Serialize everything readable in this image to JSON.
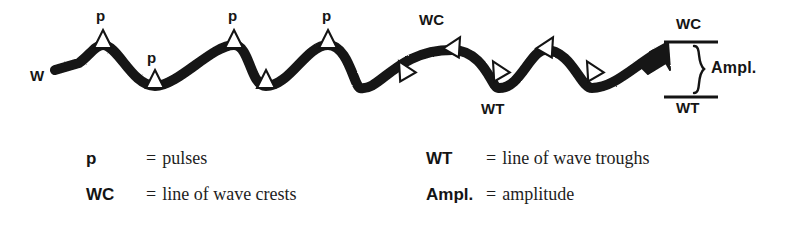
{
  "figure": {
    "type": "wave-diagram",
    "background_color": "#ffffff",
    "ink_color": "#141414",
    "wave": {
      "label": "W",
      "label_meaning_implied": "wave",
      "crest_count": 5,
      "trough_count": 5,
      "start_point": "flat stub at left, below centerline",
      "end_point": "arrowhead pointing up-right",
      "centerline_y": 68,
      "crest_y": 45,
      "trough_y": 92,
      "stroke_width": 10
    },
    "pulse_labels": [
      {
        "text": "p",
        "x": 99,
        "y": 12
      },
      {
        "text": "p",
        "x": 150,
        "y": 54
      },
      {
        "text": "p",
        "x": 231,
        "y": 12
      },
      {
        "text": "p",
        "x": 325,
        "y": 12
      }
    ],
    "wave_labels": [
      {
        "text": "W",
        "x": 34,
        "y": 74
      },
      {
        "text": "WC",
        "x": 421,
        "y": 18
      },
      {
        "text": "WT",
        "x": 482,
        "y": 104
      }
    ],
    "amplitude_bracket": {
      "top_line_label": "WC",
      "bottom_line_label": "WT",
      "brace_label": "Ampl.",
      "top_line_y": 42,
      "bottom_line_y": 97,
      "line_x_start": 664,
      "line_x_end": 718
    },
    "markers": {
      "shape": "open-triangle",
      "fill": "#ffffff",
      "outline": "#141414",
      "crest_markers": [
        {
          "x": 103,
          "y": 45,
          "rotate": 0
        },
        {
          "x": 234,
          "y": 45,
          "rotate": 0
        },
        {
          "x": 328,
          "y": 45,
          "rotate": 0
        },
        {
          "x": 452,
          "y": 50,
          "rotate": 28
        },
        {
          "x": 545,
          "y": 50,
          "rotate": 28
        }
      ],
      "trough_markers": [
        {
          "x": 155,
          "y": 86,
          "rotate": 0
        },
        {
          "x": 266,
          "y": 86,
          "rotate": 0
        },
        {
          "x": 404,
          "y": 74,
          "rotate": -28
        },
        {
          "x": 498,
          "y": 74,
          "rotate": -28
        },
        {
          "x": 592,
          "y": 74,
          "rotate": -28
        }
      ]
    }
  },
  "legend": {
    "columns": [
      {
        "name": "left",
        "rows": [
          {
            "key": "p",
            "equals": "=",
            "description": "pulses"
          },
          {
            "key": "WC",
            "equals": "=",
            "description": "line of wave crests"
          }
        ]
      },
      {
        "name": "right",
        "rows": [
          {
            "key": "WT",
            "equals": "=",
            "description": "line of wave troughs"
          },
          {
            "key": "Ampl.",
            "equals": "=",
            "description": "amplitude"
          }
        ]
      }
    ]
  }
}
